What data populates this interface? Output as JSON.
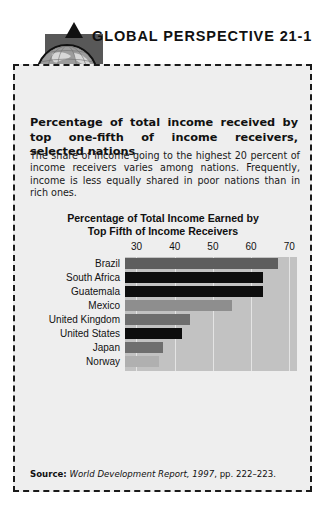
{
  "header": {
    "title": "GLOBAL PERSPECTIVE 21-1",
    "emblem_icon": "globe-icon",
    "arrow_up_icon": "arrow-up-icon",
    "arrow_down_icon": "arrow-down-icon",
    "arrow_left_icon": "arrow-left-icon",
    "arrow_right_icon": "arrow-right-icon"
  },
  "box": {
    "headline": "Percentage of total income received by top one-fifth of income receivers, selected nations",
    "body": "The share of income going to the highest 20 percent of income receivers varies among nations. Frequently, income is less equally shared in poor nations than in rich ones."
  },
  "source": {
    "label": "Source:",
    "publication": "World Development Report, 1997",
    "pages": ", pp. 222–223."
  },
  "colors": {
    "page_background": "#ffffff",
    "box_background": "#eeeeee",
    "plot_background": "#c2c2c2",
    "gridline": "#e4e4e4",
    "emblem_square": "#585858",
    "bar_black": "#0d0d0d",
    "bar_dark_gray": "#5e5e5e",
    "bar_medium_gray": "#8e8e8e",
    "bar_light_gray": "#b0b0b0",
    "text": "#111111"
  },
  "chart_data": {
    "type": "bar",
    "orientation": "horizontal",
    "title": "Percentage of Total Income Earned by Top Fifth of Income Receivers",
    "title_lines": [
      "Percentage of Total Income Earned by",
      "Top Fifth of Income Receivers"
    ],
    "xlabel": "",
    "ylabel": "",
    "xlim": [
      27,
      72
    ],
    "tick_labels": [
      "30",
      "40",
      "50",
      "60",
      "70"
    ],
    "ticks": [
      30,
      40,
      50,
      60,
      70
    ],
    "grid": true,
    "grid_axis": "x",
    "legend": "none",
    "categories": [
      "Brazil",
      "South Africa",
      "Guatemala",
      "Mexico",
      "United Kingdom",
      "United States",
      "Japan",
      "Norway"
    ],
    "values": [
      67,
      63,
      63,
      55,
      44,
      42,
      37,
      36
    ],
    "bar_colors": [
      "#5e5e5e",
      "#0d0d0d",
      "#0d0d0d",
      "#8e8e8e",
      "#6e6e6e",
      "#0d0d0d",
      "#6e6e6e",
      "#b0b0b0"
    ]
  }
}
